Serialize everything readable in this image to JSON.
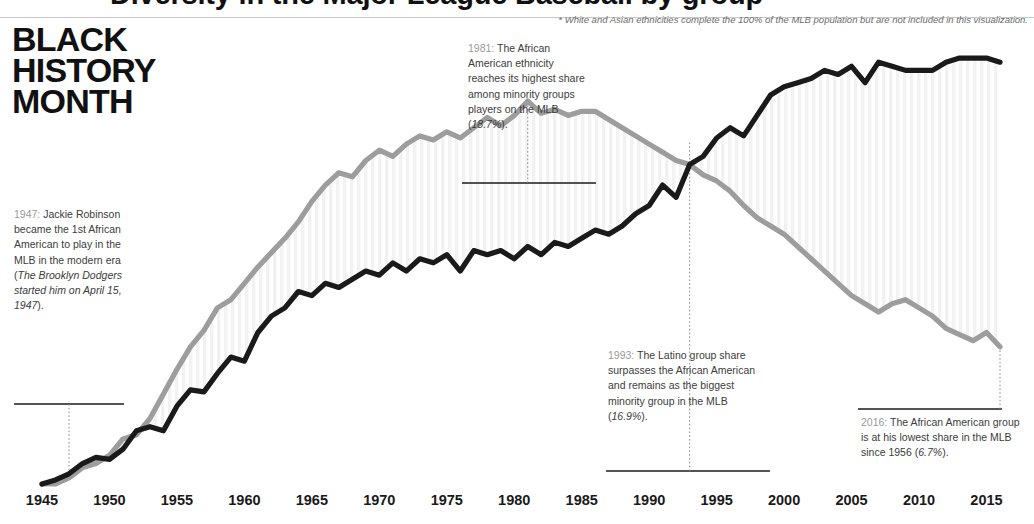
{
  "header": {
    "clipped_title": "Diversity in the Major League Baseball by group",
    "footnote": "* White and Asian ethnicities complete the 100% of the MLB population but are not included in this visualization."
  },
  "title_block": {
    "line1": "BLACK",
    "line2": "HISTORY",
    "line3": "MONTH"
  },
  "annotations": [
    {
      "id": "note-1947",
      "year_label": "1947:",
      "text": " Jackie Robinson became the 1st African American to play in the MLB in the modern era (",
      "italic": "The Brooklyn Dodgers started him on April 15, 1947",
      "tail": ")."
    },
    {
      "id": "note-1981",
      "year_label": "1981:",
      "text": " The African American ethnicity reaches its highest share among minority groups players on the MLB (",
      "italic": "18.7%",
      "tail": ")."
    },
    {
      "id": "note-1993",
      "year_label": "1993:",
      "text": " The Latino group share surpasses the African American  and remains as the biggest minority group in the MLB (",
      "italic": "16.9%",
      "tail": ")."
    },
    {
      "id": "note-2016",
      "year_label": "2016:",
      "text": " The African American group is at his lowest share in the MLB since 1956 (",
      "italic": "6.7%",
      "tail": ")."
    }
  ],
  "axis": {
    "ticks": [
      "1945",
      "1950",
      "1955",
      "1960",
      "1965",
      "1970",
      "1975",
      "1980",
      "1985",
      "1990",
      "1995",
      "2000",
      "2005",
      "2010",
      "2015"
    ]
  },
  "colors": {
    "latino_line": "#1a1a1a",
    "african_american_line": "#9d9d9d",
    "band_stripe": "#f2f2f2",
    "axis_text": "#1a1a1a",
    "note_text": "#3c3c3c",
    "note_year": "#9a9a9a",
    "rule": "#c8c8c8"
  },
  "chart_data": {
    "type": "line",
    "title": "Diversity in the Major League Baseball by group",
    "xlabel": "",
    "ylabel": "Share of MLB players (%)",
    "xlim": [
      1945,
      2016
    ],
    "ylim": [
      0,
      21
    ],
    "grid": false,
    "legend": "none",
    "x": [
      1945,
      1946,
      1947,
      1948,
      1949,
      1950,
      1951,
      1952,
      1953,
      1954,
      1955,
      1956,
      1957,
      1958,
      1959,
      1960,
      1961,
      1962,
      1963,
      1964,
      1965,
      1966,
      1967,
      1968,
      1969,
      1970,
      1971,
      1972,
      1973,
      1974,
      1975,
      1976,
      1977,
      1978,
      1979,
      1980,
      1981,
      1982,
      1983,
      1984,
      1985,
      1986,
      1987,
      1988,
      1989,
      1990,
      1991,
      1992,
      1993,
      1994,
      1995,
      1996,
      1997,
      1998,
      1999,
      2000,
      2001,
      2002,
      2003,
      2004,
      2005,
      2006,
      2007,
      2008,
      2009,
      2010,
      2011,
      2012,
      2013,
      2014,
      2015,
      2016
    ],
    "series": [
      {
        "name": "African American",
        "color": "#9d9d9d",
        "values": [
          0.0,
          0.0,
          0.3,
          0.8,
          1.0,
          1.4,
          2.2,
          2.4,
          3.2,
          4.4,
          5.6,
          6.7,
          7.5,
          8.6,
          9.0,
          9.8,
          10.6,
          11.3,
          12.0,
          12.8,
          13.8,
          14.6,
          15.2,
          15.0,
          15.8,
          16.3,
          16.0,
          16.6,
          17.0,
          16.8,
          17.2,
          16.9,
          17.4,
          17.9,
          17.5,
          18.0,
          18.7,
          18.1,
          18.3,
          18.0,
          18.2,
          18.2,
          17.8,
          17.4,
          17.0,
          16.6,
          16.2,
          15.8,
          15.6,
          15.1,
          14.8,
          14.3,
          13.6,
          13.0,
          12.6,
          12.2,
          11.6,
          11.0,
          10.4,
          9.8,
          9.2,
          8.8,
          8.4,
          8.8,
          9.0,
          8.6,
          8.2,
          7.6,
          7.3,
          7.0,
          7.4,
          6.7
        ]
      },
      {
        "name": "Latino",
        "color": "#1a1a1a",
        "values": [
          0.0,
          0.2,
          0.5,
          1.0,
          1.3,
          1.2,
          1.7,
          2.6,
          2.8,
          2.6,
          3.8,
          4.6,
          4.5,
          5.4,
          6.2,
          6.0,
          7.4,
          8.2,
          8.6,
          9.4,
          9.2,
          9.8,
          9.6,
          10.0,
          10.4,
          10.2,
          10.8,
          10.4,
          11.0,
          10.8,
          11.2,
          10.4,
          11.4,
          11.2,
          11.4,
          11.0,
          11.6,
          11.2,
          11.8,
          11.6,
          12.0,
          12.4,
          12.2,
          12.6,
          13.2,
          13.6,
          14.6,
          14.0,
          15.6,
          16.0,
          16.9,
          17.4,
          17.0,
          18.0,
          19.0,
          19.4,
          19.6,
          19.8,
          20.2,
          20.0,
          20.4,
          19.6,
          20.6,
          20.4,
          20.2,
          20.2,
          20.2,
          20.6,
          20.8,
          20.8,
          20.8,
          20.6
        ]
      }
    ],
    "callouts": [
      {
        "year": 1947,
        "note": "Jackie Robinson became the 1st African American to play in the MLB in the modern era",
        "series": "African American"
      },
      {
        "year": 1981,
        "value": 18.7,
        "note": "African American peak share",
        "series": "African American"
      },
      {
        "year": 1993,
        "value": 16.9,
        "note": "Latino surpasses African American",
        "series": "Latino"
      },
      {
        "year": 2016,
        "value": 6.7,
        "note": "African American lowest share since 1956",
        "series": "African American"
      }
    ]
  }
}
